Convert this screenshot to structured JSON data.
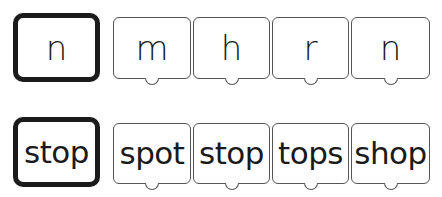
{
  "rows": [
    {
      "target": "n",
      "options": [
        "m",
        "h",
        "r",
        "n"
      ]
    },
    {
      "target": "stop",
      "options": [
        "spot",
        "stop",
        "tops",
        "shop"
      ]
    }
  ]
}
